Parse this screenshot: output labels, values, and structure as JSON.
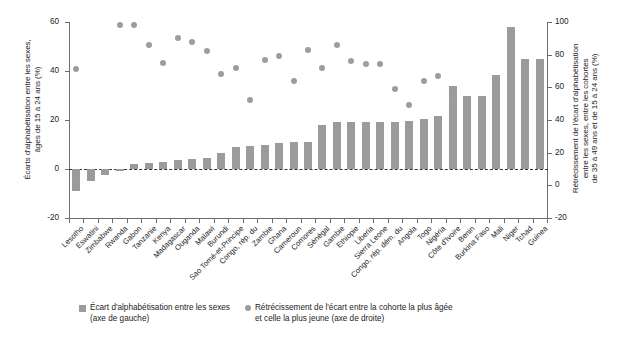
{
  "chart_data": {
    "type": "bar",
    "title": "",
    "subtitle": "",
    "grid": false,
    "legend_position": "bottom",
    "categories": [
      "Lesotho",
      "Eswatini",
      "Zimbabwe",
      "Rwanda",
      "Gabon",
      "Tanzanie",
      "Kenya",
      "Madagascar",
      "Ouganda",
      "Malawi",
      "Burundi",
      "Sao Tomé-et-Principe",
      "Congo, rép. du",
      "Zambie",
      "Ghana",
      "Cameroun",
      "Comores",
      "Sénégal",
      "Gambie",
      "Ethiopie",
      "Liberia",
      "Sierra Leone",
      "Congo, rép. dém. du",
      "Angola",
      "Togo",
      "Nigéria",
      "Côte d'Ivoire",
      "Benin",
      "Burkina Faso",
      "Mali",
      "Niger",
      "Tchad",
      "Guinea"
    ],
    "series": [
      {
        "name": "Écart d'alphabétisation entre les sexes (axe de gauche)",
        "axis": "left",
        "render": "bar",
        "color": "#9b9b9b",
        "values": [
          -9.0,
          -5.0,
          -2.5,
          -1.0,
          2.0,
          2.5,
          3.0,
          3.5,
          4.0,
          4.5,
          6.5,
          9.0,
          9.5,
          10.0,
          10.5,
          11.0,
          11.0,
          18.0,
          19.0,
          19.0,
          19.0,
          19.0,
          19.0,
          19.5,
          20.5,
          21.5,
          34.0,
          30.0,
          30.0,
          38.5,
          58.0,
          45.0,
          45.0
        ]
      },
      {
        "name": "Rétrécissement de l'écart entre la cohorte la plus âgée et celle la plus jeune (axe de droite)",
        "axis": "right",
        "render": "scatter",
        "color": "#9d9d9d",
        "values": [
          71,
          null,
          null,
          98,
          98,
          86,
          75,
          90,
          88,
          82,
          68,
          72,
          52,
          77,
          79,
          64,
          83,
          72,
          86,
          76,
          74,
          74,
          59,
          49,
          64,
          67,
          52,
          null,
          null,
          null,
          null,
          null,
          null
        ]
      }
    ],
    "left_axis": {
      "label": "Écarts d'alphabétisation entre les sexes,\nâges de 15 à 24 ans (%)",
      "ticks": [
        "60",
        "40",
        "20",
        "0",
        "-20"
      ],
      "min": -20,
      "max": 60
    },
    "right_axis": {
      "label": "Rétrécissement de l'écart d'alphabétisation\nentre les sexes, entre les cohortes\nde 35 à 49 ans et de 15 à 24 ans (%)",
      "ticks": [
        "100",
        "80",
        "60",
        "40",
        "20",
        "0",
        "-20"
      ],
      "min": -20,
      "max": 100
    },
    "xlabel": "",
    "legend": [
      {
        "marker": "square",
        "text": "Écart d'alphabétisation entre les sexes\n(axe de gauche)"
      },
      {
        "marker": "dot",
        "text": "Rétrécissement de l'écart entre la cohorte la plus âgée\net celle la plus jeune (axe de droite)"
      }
    ]
  }
}
